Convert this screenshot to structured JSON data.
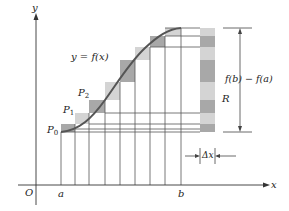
{
  "figure": {
    "axes": {
      "x_label": "x",
      "y_label": "y",
      "origin_label": "O",
      "a_label": "a",
      "b_label": "b"
    },
    "curve_label": "y = f(x)",
    "points": [
      {
        "name": "P",
        "sub": "0"
      },
      {
        "name": "P",
        "sub": "1"
      },
      {
        "name": "P",
        "sub": "2"
      }
    ],
    "difference_label": "f(b) − f(a)",
    "region_label": "R",
    "delta_label": "Δx",
    "colors": {
      "dark_rect": "#a8a8a8",
      "light_rect": "#d4d4d4",
      "curve": "#555555",
      "lines": "#444444"
    },
    "subdivisions": 8
  }
}
